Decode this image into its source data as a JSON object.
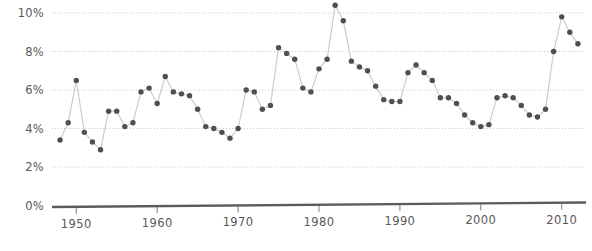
{
  "chart_data": {
    "type": "line",
    "title": "",
    "subtitle": "",
    "xlabel": "",
    "ylabel": "",
    "xlim": [
      1947.0,
      2013.0
    ],
    "ylim": [
      0,
      10.8
    ],
    "grid": true,
    "legend_position": "none",
    "marker": "filled-circle",
    "y_tick_labels": [
      "0%",
      "2%",
      "4%",
      "6%",
      "8%",
      "10%"
    ],
    "y_tick_values": [
      0,
      2,
      4,
      6,
      8,
      10
    ],
    "x_tick_labels": [
      "1950",
      "1960",
      "1970",
      "1980",
      "1990",
      "2000",
      "2010"
    ],
    "x_tick_values": [
      1950,
      1960,
      1970,
      1980,
      1990,
      2000,
      2010
    ],
    "series": [
      {
        "name": "Unemployment rate",
        "color": "#4d4f53",
        "line_color": "#c9cacc",
        "x": [
          1948,
          1949,
          1950,
          1951,
          1952,
          1953,
          1954,
          1955,
          1956,
          1957,
          1958,
          1959,
          1960,
          1961,
          1962,
          1963,
          1964,
          1965,
          1966,
          1967,
          1968,
          1969,
          1970,
          1971,
          1972,
          1973,
          1974,
          1975,
          1976,
          1977,
          1978,
          1979,
          1980,
          1981,
          1982,
          1983,
          1984,
          1985,
          1986,
          1987,
          1988,
          1989,
          1990,
          1991,
          1992,
          1993,
          1994,
          1995,
          1996,
          1997,
          1998,
          1999,
          2000,
          2001,
          2002,
          2003,
          2004,
          2005,
          2006,
          2007,
          2008,
          2009,
          2010,
          2011,
          2012
        ],
        "values": [
          3.4,
          4.3,
          6.5,
          3.8,
          3.3,
          2.9,
          4.9,
          4.9,
          4.1,
          4.3,
          5.9,
          6.1,
          5.3,
          6.7,
          5.9,
          5.8,
          5.7,
          5.0,
          4.1,
          4.0,
          3.8,
          3.5,
          4.0,
          6.0,
          5.9,
          5.0,
          5.2,
          8.2,
          7.9,
          7.6,
          6.1,
          5.9,
          7.1,
          7.6,
          10.4,
          9.6,
          7.5,
          7.2,
          7.0,
          6.2,
          5.5,
          5.4,
          5.4,
          6.9,
          7.3,
          6.9,
          6.5,
          5.6,
          5.6,
          5.3,
          4.7,
          4.3,
          4.1,
          4.2,
          5.6,
          5.7,
          5.6,
          5.2,
          4.7,
          4.6,
          5.0,
          8.0,
          9.8,
          9.0,
          8.4
        ]
      }
    ]
  }
}
